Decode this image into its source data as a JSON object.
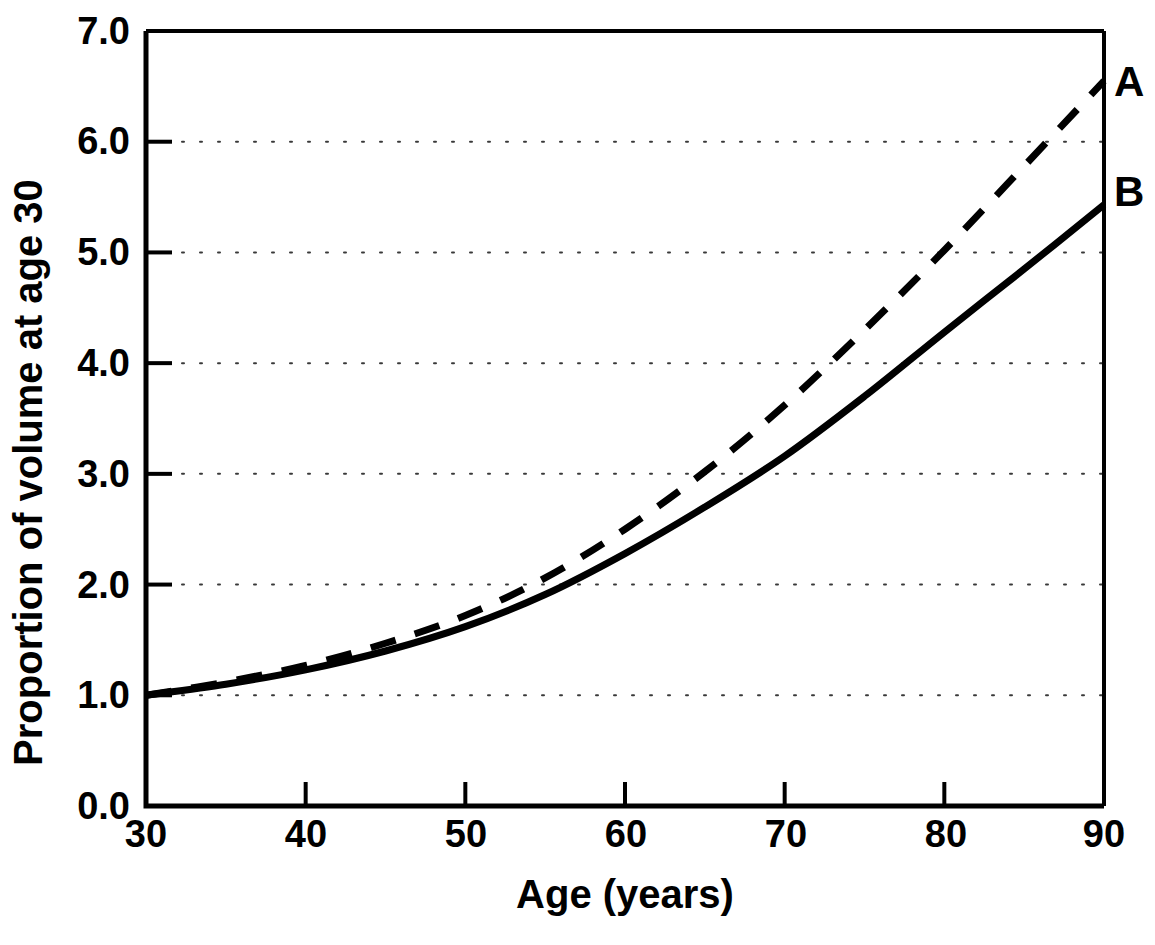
{
  "chart_data": {
    "type": "line",
    "title": "",
    "subtitle": "",
    "xlabel": "Age (years)",
    "ylabel": "Proportion of volume at age 30",
    "xlim": [
      30,
      90
    ],
    "ylim": [
      0.0,
      7.0
    ],
    "xticks": [
      "30",
      "40",
      "50",
      "60",
      "70",
      "80",
      "90"
    ],
    "yticks": [
      "0.0",
      "1.0",
      "2.0",
      "3.0",
      "4.0",
      "5.0",
      "6.0",
      "7.0"
    ],
    "grid": "horizontal-dotted",
    "legend_position": "right-of-axes-inline",
    "x": [
      30,
      35,
      40,
      45,
      50,
      55,
      60,
      65,
      70,
      75,
      80,
      85,
      90
    ],
    "series": [
      {
        "name": "A",
        "label": "A",
        "style": "dashed",
        "color": "#000000",
        "values": [
          1.0,
          1.12,
          1.27,
          1.47,
          1.72,
          2.06,
          2.5,
          3.02,
          3.62,
          4.3,
          5.02,
          5.78,
          6.55
        ]
      },
      {
        "name": "B",
        "label": "B",
        "style": "solid",
        "color": "#000000",
        "values": [
          1.0,
          1.1,
          1.23,
          1.4,
          1.62,
          1.91,
          2.28,
          2.7,
          3.16,
          3.7,
          4.28,
          4.85,
          5.43
        ]
      }
    ],
    "annotations": [
      {
        "text": "A",
        "x": 90,
        "y": 6.55
      },
      {
        "text": "B",
        "x": 90,
        "y": 5.43
      }
    ]
  },
  "axes": {
    "frame_color": "#000000"
  }
}
